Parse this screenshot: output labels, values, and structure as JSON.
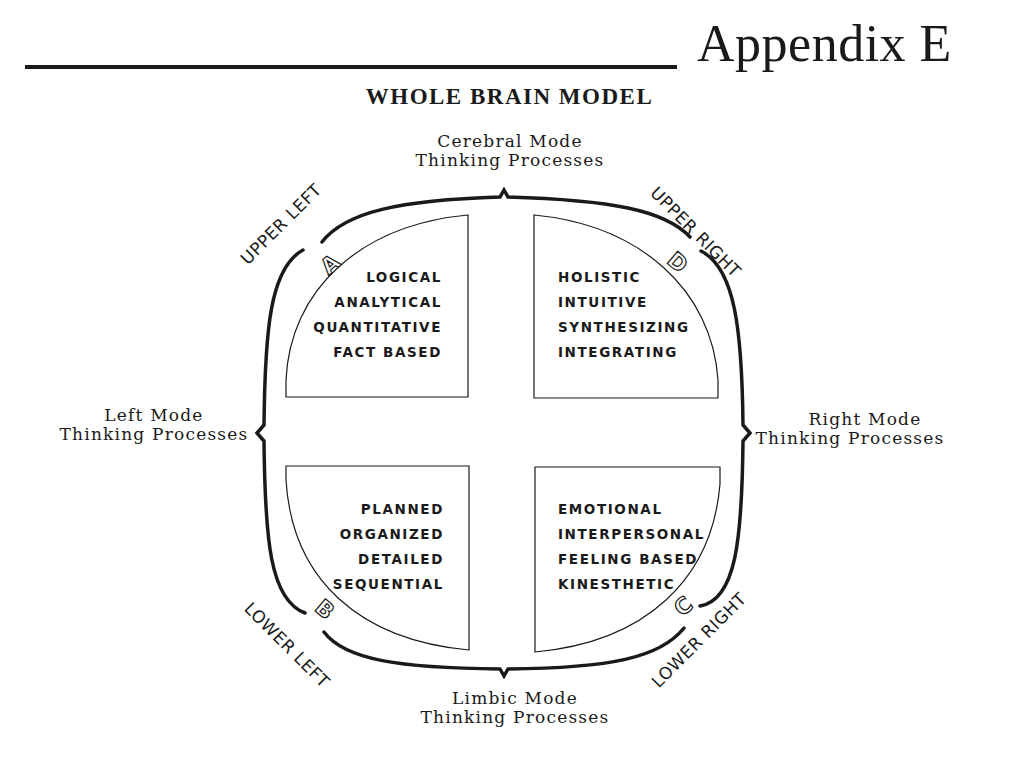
{
  "header": {
    "appendix_label": "Appendix E",
    "title": "WHOLE BRAIN MODEL"
  },
  "modes": {
    "top": {
      "line1": "Cerebral Mode",
      "line2": "Thinking Processes"
    },
    "bottom": {
      "line1": "Limbic Mode",
      "line2": "Thinking Processes"
    },
    "left": {
      "line1": "Left Mode",
      "line2": "Thinking Processes"
    },
    "right": {
      "line1": "Right Mode",
      "line2": "Thinking Processes"
    }
  },
  "quadrants": {
    "A": {
      "letter": "A",
      "position_label": "UPPER LEFT",
      "traits": [
        "LOGICAL",
        "ANALYTICAL",
        "QUANTITATIVE",
        "FACT BASED"
      ]
    },
    "B": {
      "letter": "B",
      "position_label": "LOWER LEFT",
      "traits": [
        "PLANNED",
        "ORGANIZED",
        "DETAILED",
        "SEQUENTIAL"
      ]
    },
    "C": {
      "letter": "C",
      "position_label": "LOWER RIGHT",
      "traits": [
        "EMOTIONAL",
        "INTERPERSONAL",
        "FEELING BASED",
        "KINESTHETIC"
      ]
    },
    "D": {
      "letter": "D",
      "position_label": "UPPER RIGHT",
      "traits": [
        "HOLISTIC",
        "INTUITIVE",
        "SYNTHESIZING",
        "INTEGRATING"
      ]
    }
  },
  "colors": {
    "ink": "#1a1a1a",
    "background": "#ffffff"
  }
}
